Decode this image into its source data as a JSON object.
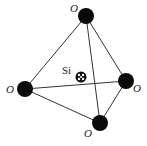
{
  "diagram": {
    "colors": {
      "oxygen": "#0a0a0a",
      "edge": "#333333",
      "background": "#ffffff"
    },
    "oxygen_atoms": [
      {
        "id": "top",
        "label": "O",
        "cx": 86,
        "cy": 16,
        "r": 8,
        "lx": 70,
        "ly": 12
      },
      {
        "id": "left",
        "label": "O",
        "cx": 25,
        "cy": 89,
        "r": 8,
        "lx": 6,
        "ly": 93
      },
      {
        "id": "right",
        "label": "O",
        "cx": 126,
        "cy": 81,
        "r": 8,
        "lx": 133,
        "ly": 92
      },
      {
        "id": "bottom",
        "label": "O",
        "cx": 100,
        "cy": 123,
        "r": 8,
        "lx": 84,
        "ly": 137
      }
    ],
    "silicon_atom": {
      "label": "Si",
      "cx": 81,
      "cy": 77,
      "r": 5,
      "lx": 62,
      "ly": 74
    },
    "edges": [
      [
        "top",
        "left"
      ],
      [
        "top",
        "right"
      ],
      [
        "top",
        "bottom"
      ],
      [
        "left",
        "right"
      ],
      [
        "left",
        "bottom"
      ],
      [
        "right",
        "bottom"
      ]
    ]
  }
}
